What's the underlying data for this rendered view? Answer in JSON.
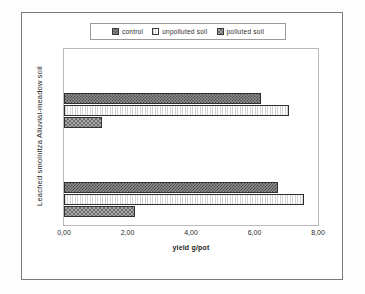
{
  "chart_data": {
    "type": "bar",
    "orientation": "horizontal",
    "title": "",
    "xlabel": "yield g/pot",
    "ylabel": "",
    "categories": [
      "Alluvial-meadow soil",
      "Leached smolnitza"
    ],
    "series": [
      {
        "name": "control",
        "values": [
          6.2,
          6.75
        ]
      },
      {
        "name": "unpolluted soil",
        "values": [
          7.1,
          7.55
        ]
      },
      {
        "name": "polluted soil",
        "values": [
          1.2,
          2.25
        ]
      }
    ],
    "xlim": [
      0,
      8
    ],
    "xticks": [
      "0,00",
      "2,00",
      "4,00",
      "6,00",
      "8,00"
    ],
    "xtick_values": [
      0,
      2,
      4,
      6,
      8
    ],
    "grid": false,
    "legend_position": "top"
  },
  "legend": {
    "items": [
      {
        "label": "control",
        "pattern": "checkerboard-dark"
      },
      {
        "label": "unpolluted soil",
        "pattern": "vertical-lines-light"
      },
      {
        "label": "polluted soil",
        "pattern": "dotted-gray"
      }
    ]
  },
  "axis": {
    "y_title": "Leached smolnitza   Alluvial-meadow soil",
    "x_title": "yield g/pot"
  }
}
